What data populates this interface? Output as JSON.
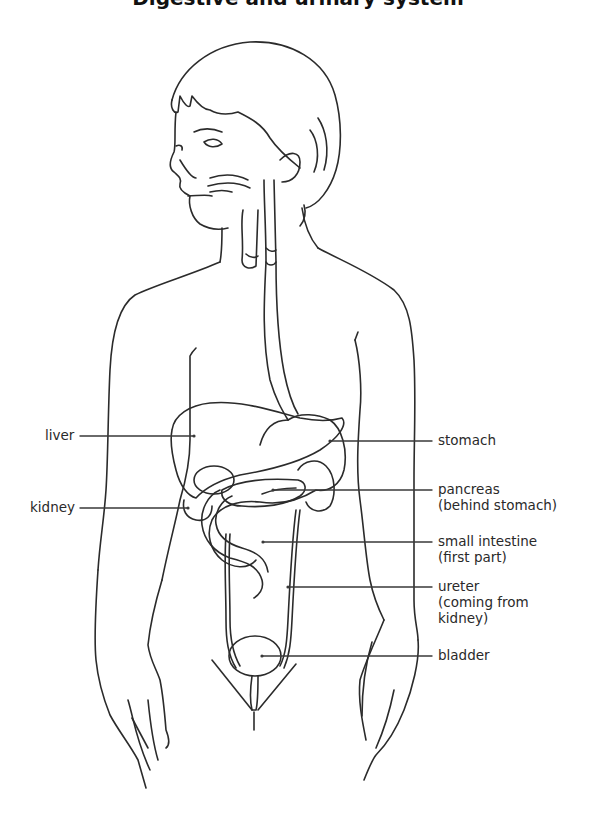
{
  "title": "Digestive and urinary system",
  "labels": {
    "liver": "liver",
    "kidney": "kidney",
    "stomach": "stomach",
    "pancreas": "pancreas",
    "pancreas_note": "(behind stomach)",
    "small_intestine": "small intestine",
    "small_intestine_note": "(first part)",
    "ureter": "ureter",
    "ureter_note_1": "(coming from",
    "ureter_note_2": "kidney)",
    "bladder": "bladder"
  },
  "colors": {
    "line": "#2b2b2b",
    "text": "#2a2a2a",
    "background": "#ffffff"
  }
}
